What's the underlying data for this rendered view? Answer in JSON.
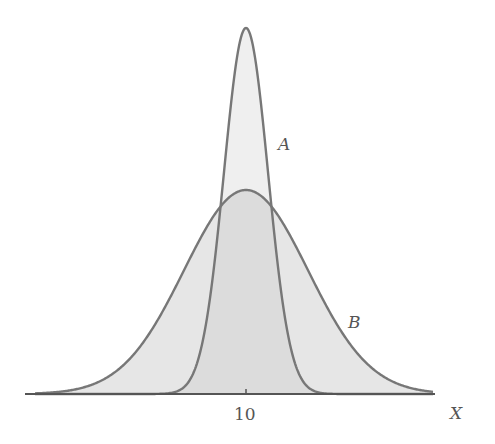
{
  "chart_data": {
    "type": "area",
    "title": "",
    "xlabel": "X",
    "ylabel": "",
    "x_ticks": [
      {
        "value": 10,
        "label": "10"
      }
    ],
    "grid": false,
    "legend": "none (curves labeled inline)",
    "series": [
      {
        "name": "A",
        "shape": "normal",
        "mean": 10,
        "relative_spread": 1.0,
        "relative_peak_height": 1.0,
        "fill": "#ededed",
        "stroke": "#777777"
      },
      {
        "name": "B",
        "shape": "normal",
        "mean": 10,
        "relative_spread": 2.8,
        "relative_peak_height": 0.56,
        "fill": "#e4e4e4",
        "stroke": "#777777"
      }
    ],
    "annotations": [
      {
        "text": "A",
        "near": "right flank of curve A"
      },
      {
        "text": "B",
        "near": "right tail of curve B"
      }
    ]
  },
  "labels": {
    "curve_a": "A",
    "curve_b": "B",
    "tick_10": "10",
    "x_axis": "X"
  },
  "layout": {
    "axis_left": 25,
    "axis_right": 435,
    "baseline_y": 394,
    "center_x": 246,
    "peak_a_y": 28,
    "peak_b_y": 190,
    "sigma_a_px": 22,
    "sigma_b_px": 62
  }
}
